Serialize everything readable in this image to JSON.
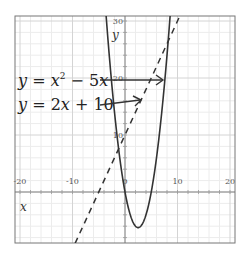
{
  "chart_data": {
    "type": "line",
    "title": "",
    "xlabel": "x",
    "ylabel": "y",
    "xlim": [
      -20,
      20
    ],
    "ylim": [
      -9,
      31
    ],
    "grid": true,
    "minor_grid_step": 2,
    "x_ticks": [
      -20,
      -10,
      0,
      10,
      20
    ],
    "x_tick_labels": [
      "-20",
      "-10",
      "0",
      "10",
      "20"
    ],
    "y_ticks": [
      10,
      20,
      30
    ],
    "y_tick_labels": [
      "10",
      "20",
      "30"
    ],
    "series": [
      {
        "name": "y = x^2 - 5x",
        "style": "solid",
        "color": "#333333",
        "equation": "x^2 - 5x",
        "x": [
          -4,
          -3,
          -2,
          -1,
          0,
          1,
          2,
          2.5,
          3,
          4,
          5,
          6,
          7,
          8,
          9
        ],
        "y": [
          36,
          24,
          14,
          6,
          0,
          -4,
          -6,
          -6.25,
          -6,
          -4,
          0,
          6,
          14,
          24,
          36
        ]
      },
      {
        "name": "y = 2x + 10",
        "style": "dashed",
        "color": "#333333",
        "equation": "2x + 10",
        "x": [
          -9.5,
          10.5
        ],
        "y": [
          -9,
          31
        ]
      }
    ],
    "annotations": [
      {
        "text_prefix": "y = x",
        "superscript": "2",
        "text_suffix": " − 5x",
        "arrow_to": [
          7.2,
          20
        ]
      },
      {
        "text": "y = 2x + 10",
        "arrow_to": [
          1.8,
          14.5
        ]
      }
    ]
  },
  "labels": {
    "x_axis": "x",
    "y_axis": "y",
    "eq1_a": "y",
    "eq1_b": " = ",
    "eq1_c": "x",
    "eq1_sup": "2",
    "eq1_d": " − 5",
    "eq1_e": "x",
    "eq2_a": "y",
    "eq2_b": " = 2",
    "eq2_c": "x",
    "eq2_d": " + 10"
  }
}
